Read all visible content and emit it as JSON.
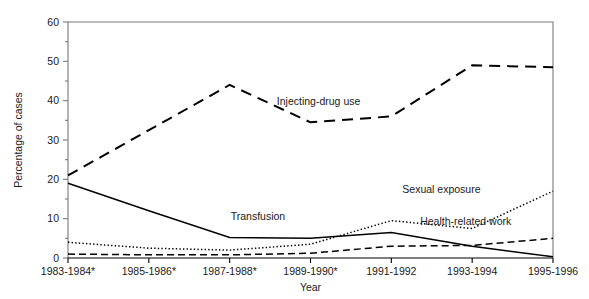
{
  "chart_data": {
    "type": "line",
    "title": "",
    "xlabel": "Year",
    "ylabel": "Percentage of cases",
    "ylim": [
      0,
      60
    ],
    "yticks": [
      0,
      10,
      20,
      30,
      40,
      50,
      60
    ],
    "ytick_labels": [
      "0",
      "10",
      "20",
      "30",
      "40",
      "50",
      "60"
    ],
    "minor_ytick_step": 5,
    "grid": false,
    "legend": "inline-annotations",
    "categories": [
      "1983-1984*",
      "1985-1986*",
      "1987-1988*",
      "1989-1990*",
      "1991-1992",
      "1993-1994",
      "1995-1996"
    ],
    "series": [
      {
        "name": "Injecting-drug use",
        "style": "dashed",
        "label_x_index": 3.1,
        "values": [
          21.0,
          32.5,
          44.0,
          34.5,
          36.0,
          49.0,
          48.5
        ]
      },
      {
        "name": "Transfusion",
        "style": "solid",
        "label_x_index": 2.35,
        "values": [
          19.0,
          12.0,
          5.2,
          5.0,
          6.5,
          3.0,
          0.3
        ]
      },
      {
        "name": "Sexual exposure",
        "style": "dotted",
        "label_x_index": 4.6,
        "values": [
          4.0,
          2.5,
          2.0,
          3.5,
          9.5,
          7.5,
          17.0
        ]
      },
      {
        "name": "Health-related work",
        "style": "dash-dot",
        "label_x_index": 4.8,
        "values": [
          1.0,
          0.8,
          0.8,
          1.2,
          3.0,
          3.2,
          5.0
        ]
      }
    ],
    "footnote_marker": "*",
    "colors": {
      "line": "#000000",
      "axis": "#7a7a7a",
      "text": "#1a1a1a",
      "background": "#ffffff"
    }
  }
}
